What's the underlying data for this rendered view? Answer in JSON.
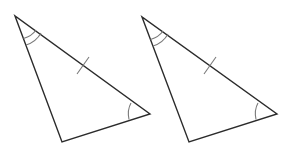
{
  "diagram": {
    "colors": {
      "background": "#ffffff",
      "sides": "#2b2b2b",
      "marks": "#7a7a7a"
    },
    "triangles": [
      {
        "id": "triangle-left",
        "vertices": {
          "top": [
            15,
            16
          ],
          "bottom": [
            62,
            142
          ],
          "right": [
            150,
            114
          ]
        },
        "marks": {
          "top_angle": "double-arc",
          "right_angle": "single-arc",
          "top_right_side": "single-tick"
        }
      },
      {
        "id": "triangle-right",
        "vertices": {
          "top": [
            142,
            17
          ],
          "bottom": [
            189,
            142
          ],
          "right": [
            277,
            114
          ]
        },
        "marks": {
          "top_angle": "double-arc",
          "right_angle": "single-arc",
          "top_right_side": "single-tick"
        }
      }
    ]
  }
}
